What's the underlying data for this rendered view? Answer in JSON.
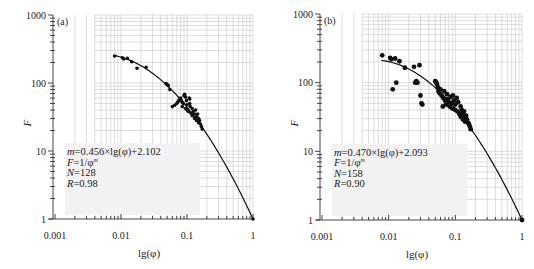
{
  "chart_data": [
    {
      "type": "scatter",
      "panel_label": "(a)",
      "xlabel": "lg(φ)",
      "ylabel": "F",
      "xscale": "log",
      "yscale": "log",
      "xlim": [
        0.001,
        1
      ],
      "ylim": [
        1,
        1000
      ],
      "x_ticks": [
        "0.001",
        "0.01",
        "0.1",
        "1"
      ],
      "y_ticks": [
        "1",
        "10",
        "100",
        "1000"
      ],
      "grid": true,
      "annotation": [
        "m=0.456×lg(φ)+2.102",
        "F=1/φ^m",
        "N=128",
        "R=0.98"
      ],
      "fit": {
        "a": 0.456,
        "b": 2.102,
        "label": "F=1/φ^m, m=0.456×lg(φ)+2.102"
      },
      "points": [
        [
          0.008,
          250
        ],
        [
          0.0105,
          235
        ],
        [
          0.011,
          225
        ],
        [
          0.0125,
          230
        ],
        [
          0.0145,
          205
        ],
        [
          0.0175,
          165
        ],
        [
          0.024,
          170
        ],
        [
          0.048,
          98
        ],
        [
          0.05,
          95
        ],
        [
          0.052,
          92
        ],
        [
          0.055,
          80
        ],
        [
          0.06,
          45
        ],
        [
          0.065,
          47
        ],
        [
          0.07,
          50
        ],
        [
          0.072,
          52
        ],
        [
          0.075,
          55
        ],
        [
          0.078,
          58
        ],
        [
          0.08,
          60
        ],
        [
          0.082,
          55
        ],
        [
          0.085,
          52
        ],
        [
          0.088,
          50
        ],
        [
          0.09,
          65
        ],
        [
          0.092,
          68
        ],
        [
          0.095,
          62
        ],
        [
          0.098,
          55
        ],
        [
          0.1,
          48
        ],
        [
          0.1,
          40
        ],
        [
          0.105,
          38
        ],
        [
          0.108,
          60
        ],
        [
          0.11,
          58
        ],
        [
          0.112,
          45
        ],
        [
          0.115,
          36
        ],
        [
          0.12,
          42
        ],
        [
          0.12,
          33
        ],
        [
          0.125,
          38
        ],
        [
          0.13,
          35
        ],
        [
          0.13,
          30
        ],
        [
          0.135,
          40
        ],
        [
          0.14,
          32
        ],
        [
          0.14,
          28
        ],
        [
          0.145,
          35
        ],
        [
          0.15,
          30
        ],
        [
          0.15,
          26
        ],
        [
          0.155,
          28
        ],
        [
          0.16,
          25
        ],
        [
          0.165,
          23
        ],
        [
          0.17,
          21
        ],
        [
          0.085,
          45
        ],
        [
          0.095,
          42
        ],
        [
          0.11,
          50
        ],
        [
          1.0,
          1
        ]
      ]
    },
    {
      "type": "scatter",
      "panel_label": "(b)",
      "xlabel": "lg(φ)",
      "ylabel": "F",
      "xscale": "log",
      "yscale": "log",
      "xlim": [
        0.001,
        1
      ],
      "ylim": [
        1,
        1000
      ],
      "x_ticks": [
        "0.001",
        "0.01",
        "0.1",
        "1"
      ],
      "y_ticks": [
        "1",
        "10",
        "100",
        "1000"
      ],
      "grid": true,
      "annotation": [
        "m=0.470×lg(φ)+2.093",
        "F=1/φ^m",
        "N=158",
        "R=0.90"
      ],
      "fit": {
        "a": 0.47,
        "b": 2.093,
        "label": "F=1/φ^m, m=0.470×lg(φ)+2.093"
      },
      "points": [
        [
          0.008,
          250
        ],
        [
          0.0105,
          230
        ],
        [
          0.011,
          220
        ],
        [
          0.0125,
          225
        ],
        [
          0.0145,
          205
        ],
        [
          0.0175,
          165
        ],
        [
          0.0115,
          80
        ],
        [
          0.013,
          100
        ],
        [
          0.025,
          100
        ],
        [
          0.026,
          105
        ],
        [
          0.027,
          100
        ],
        [
          0.024,
          170
        ],
        [
          0.029,
          180
        ],
        [
          0.03,
          65
        ],
        [
          0.031,
          50
        ],
        [
          0.032,
          48
        ],
        [
          0.05,
          105
        ],
        [
          0.052,
          100
        ],
        [
          0.053,
          95
        ],
        [
          0.055,
          85
        ],
        [
          0.056,
          75
        ],
        [
          0.058,
          70
        ],
        [
          0.06,
          80
        ],
        [
          0.062,
          65
        ],
        [
          0.065,
          45
        ],
        [
          0.066,
          60
        ],
        [
          0.068,
          75
        ],
        [
          0.07,
          55
        ],
        [
          0.072,
          48
        ],
        [
          0.075,
          68
        ],
        [
          0.078,
          58
        ],
        [
          0.08,
          52
        ],
        [
          0.082,
          45
        ],
        [
          0.085,
          62
        ],
        [
          0.088,
          50
        ],
        [
          0.09,
          42
        ],
        [
          0.092,
          65
        ],
        [
          0.095,
          55
        ],
        [
          0.1,
          48
        ],
        [
          0.1,
          40
        ],
        [
          0.105,
          60
        ],
        [
          0.108,
          38
        ],
        [
          0.11,
          52
        ],
        [
          0.115,
          35
        ],
        [
          0.12,
          45
        ],
        [
          0.12,
          32
        ],
        [
          0.125,
          40
        ],
        [
          0.13,
          35
        ],
        [
          0.13,
          29
        ],
        [
          0.135,
          38
        ],
        [
          0.14,
          31
        ],
        [
          0.14,
          27
        ],
        [
          0.145,
          33
        ],
        [
          0.15,
          29
        ],
        [
          0.155,
          26
        ],
        [
          0.16,
          25
        ],
        [
          0.165,
          23
        ],
        [
          0.17,
          21
        ],
        [
          1.0,
          1
        ]
      ]
    }
  ]
}
